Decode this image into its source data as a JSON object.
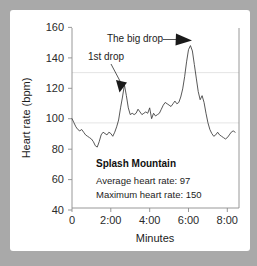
{
  "chart_data": {
    "type": "line",
    "title": "",
    "xlabel": "Minutes",
    "ylabel": "Heart rate (bpm)",
    "ylim": [
      30,
      163
    ],
    "xlim": [
      0,
      8.6
    ],
    "yticks": [
      40,
      60,
      80,
      100,
      120,
      140,
      160
    ],
    "ytick_labels": [
      "40",
      "60",
      "80",
      "100",
      "120",
      "140",
      "160"
    ],
    "xticks": [
      0,
      2,
      4,
      6,
      8
    ],
    "xtick_labels": [
      "0",
      "2:00",
      "4:00",
      "6:00",
      "8:00"
    ],
    "grid": "horizontal-faint",
    "gridline_values": [
      97,
      130
    ],
    "legend": "none",
    "series": [
      {
        "name": "Heart rate",
        "color": "#3a3a3a",
        "x": [
          0.0,
          0.1,
          0.2,
          0.3,
          0.4,
          0.5,
          0.6,
          0.7,
          0.8,
          0.9,
          1.0,
          1.1,
          1.2,
          1.3,
          1.4,
          1.5,
          1.6,
          1.7,
          1.8,
          1.9,
          2.0,
          2.1,
          2.2,
          2.3,
          2.4,
          2.5,
          2.6,
          2.7,
          2.8,
          2.9,
          3.0,
          3.1,
          3.2,
          3.3,
          3.4,
          3.5,
          3.6,
          3.7,
          3.8,
          3.9,
          4.0,
          4.1,
          4.2,
          4.3,
          4.4,
          4.5,
          4.6,
          4.7,
          4.8,
          4.9,
          5.0,
          5.1,
          5.2,
          5.3,
          5.4,
          5.5,
          5.6,
          5.7,
          5.8,
          5.9,
          6.0,
          6.1,
          6.2,
          6.3,
          6.4,
          6.5,
          6.6,
          6.7,
          6.8,
          6.9,
          7.0,
          7.1,
          7.2,
          7.3,
          7.4,
          7.5,
          7.6,
          7.7,
          7.8,
          7.9,
          8.0,
          8.1,
          8.2,
          8.3,
          8.4
        ],
        "y": [
          96,
          93,
          90,
          88,
          87,
          88,
          86,
          84,
          83,
          82,
          81,
          79,
          76,
          75,
          79,
          84,
          86,
          85,
          84,
          86,
          85,
          83,
          86,
          90,
          95,
          104,
          112,
          121,
          113,
          104,
          99,
          100,
          99,
          100,
          103,
          101,
          99,
          100,
          101,
          100,
          104,
          96,
          100,
          98,
          99,
          100,
          103,
          106,
          108,
          107,
          106,
          105,
          107,
          109,
          107,
          108,
          112,
          118,
          127,
          138,
          147,
          150,
          146,
          136,
          126,
          116,
          110,
          113,
          108,
          100,
          93,
          88,
          85,
          83,
          84,
          86,
          84,
          83,
          82,
          81,
          82,
          84,
          86,
          87,
          86
        ]
      }
    ],
    "annotations": [
      {
        "id": "big-drop",
        "text": "The big drop",
        "text_x": 3.3,
        "text_y": 157,
        "target_x": 6.1,
        "target_y": 151,
        "arrow": "right"
      },
      {
        "id": "first-drop",
        "text": "1st drop",
        "text_x": 1.55,
        "text_y": 140,
        "target_x": 2.68,
        "target_y": 122,
        "arrow": "down-right"
      }
    ],
    "stats_box": {
      "title": "Splash Mountain",
      "lines": [
        "Average heart rate: 97",
        "Maximum heart rate: 150"
      ],
      "average_heart_rate": 97,
      "maximum_heart_rate": 150
    }
  }
}
